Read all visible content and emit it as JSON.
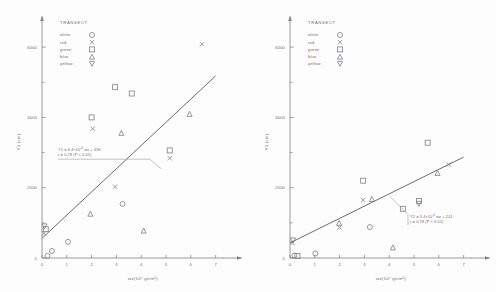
{
  "figure": {
    "background": "#fdfdfd",
    "ink": "#6e6e76",
    "marker_stroke": "#77777f"
  },
  "legend": {
    "title": "TRANSECT",
    "entries": [
      {
        "label": "white",
        "symbol": "circle",
        "icon": "circle-marker-icon"
      },
      {
        "label": "red",
        "symbol": "cross",
        "icon": "x-marker-icon"
      },
      {
        "label": "green",
        "symbol": "square",
        "icon": "square-marker-icon"
      },
      {
        "label": "blue",
        "symbol": "triangle-up",
        "icon": "triangle-up-marker-icon"
      },
      {
        "label": "yellow",
        "symbol": "triangle-down",
        "icon": "triangle-down-marker-icon"
      }
    ]
  },
  "chart_data": [
    {
      "id": "panel-left",
      "type": "scatter",
      "title": "",
      "xlabel": "wz(10⁴ g/cm³)",
      "ylabel": "Y1 (cm)",
      "xlim": [
        0,
        7.5
      ],
      "ylim": [
        0,
        6600
      ],
      "xticks": [
        0,
        1,
        2,
        3,
        4,
        5,
        6,
        7
      ],
      "xtick_labels": [
        "0",
        "1",
        "2",
        "3",
        "4",
        "5",
        "6",
        "7"
      ],
      "yticks": [
        0,
        2000,
        4000,
        6000
      ],
      "ytick_labels": [
        "0",
        "2000",
        "4000",
        "6000"
      ],
      "grid": false,
      "legend_position": "top-left",
      "annotation": {
        "line1_pre": "Y1 = 6.4×10",
        "line1_exp": "-4",
        "line1_post": " wz + 494",
        "line2": "r = 0.78 (P < 0.01)"
      },
      "regression": {
        "x0": 0.0,
        "y0": 560,
        "x1": 7.0,
        "y1": 5180
      },
      "series": [
        {
          "name": "white",
          "symbol": "circle",
          "points": [
            {
              "x": 0.22,
              "y": 60
            },
            {
              "x": 0.4,
              "y": 200
            },
            {
              "x": 1.05,
              "y": 460
            },
            {
              "x": 3.25,
              "y": 1540
            }
          ]
        },
        {
          "name": "red",
          "symbol": "cross",
          "points": [
            {
              "x": 0.08,
              "y": 700
            },
            {
              "x": 2.05,
              "y": 3680
            },
            {
              "x": 2.95,
              "y": 2030
            },
            {
              "x": 5.15,
              "y": 2840
            },
            {
              "x": 6.45,
              "y": 6080
            }
          ]
        },
        {
          "name": "green",
          "symbol": "square",
          "points": [
            {
              "x": 0.15,
              "y": 820
            },
            {
              "x": 2.0,
              "y": 4000
            },
            {
              "x": 2.95,
              "y": 4860
            },
            {
              "x": 3.62,
              "y": 4680
            },
            {
              "x": 5.15,
              "y": 3060
            }
          ]
        },
        {
          "name": "blue",
          "symbol": "triangle-up",
          "points": [
            {
              "x": 1.95,
              "y": 1260
            },
            {
              "x": 3.2,
              "y": 3560
            },
            {
              "x": 4.1,
              "y": 780
            },
            {
              "x": 5.95,
              "y": 4100
            }
          ]
        },
        {
          "name": "yellow",
          "symbol": "triangle-down",
          "points": [
            {
              "x": 0.1,
              "y": 900
            }
          ]
        }
      ]
    },
    {
      "id": "panel-right",
      "type": "scatter",
      "title": "",
      "xlabel": "wz(10⁴ g/cm³)",
      "ylabel": "Y2 (cm)",
      "xlim": [
        0,
        7.5
      ],
      "ylim": [
        0,
        6600
      ],
      "xticks": [
        0,
        1,
        2,
        3,
        4,
        5,
        6,
        7
      ],
      "xtick_labels": [
        "0",
        "1",
        "2",
        "3",
        "4",
        "5",
        "6",
        "7"
      ],
      "yticks": [
        0,
        2000,
        4000,
        6000
      ],
      "ytick_labels": [
        "0",
        "2000",
        "4000",
        "6000"
      ],
      "grid": false,
      "legend_position": "top-left",
      "annotation": {
        "line1_pre": "Y2 = 5.4×10",
        "line1_exp": "-4",
        "line1_post": " wz + 241",
        "line2": "r = 0.78 (P < 0.01)"
      },
      "regression": {
        "x0": 0.0,
        "y0": 430,
        "x1": 7.0,
        "y1": 2870
      },
      "series": [
        {
          "name": "white",
          "symbol": "circle",
          "points": [
            {
              "x": 0.18,
              "y": 70
            },
            {
              "x": 1.02,
              "y": 130
            },
            {
              "x": 3.22,
              "y": 880
            }
          ]
        },
        {
          "name": "red",
          "symbol": "cross",
          "points": [
            {
              "x": 0.1,
              "y": 430
            },
            {
              "x": 2.0,
              "y": 870
            },
            {
              "x": 2.95,
              "y": 1650
            },
            {
              "x": 6.4,
              "y": 2660
            }
          ]
        },
        {
          "name": "green",
          "symbol": "square",
          "points": [
            {
              "x": 0.3,
              "y": 60
            },
            {
              "x": 2.95,
              "y": 2200
            },
            {
              "x": 4.55,
              "y": 1400
            },
            {
              "x": 5.2,
              "y": 1620
            },
            {
              "x": 5.55,
              "y": 3280
            }
          ]
        },
        {
          "name": "blue",
          "symbol": "triangle-up",
          "points": [
            {
              "x": 1.98,
              "y": 1000
            },
            {
              "x": 3.3,
              "y": 1680
            },
            {
              "x": 4.15,
              "y": 300
            },
            {
              "x": 5.95,
              "y": 2420
            }
          ]
        },
        {
          "name": "yellow",
          "symbol": "triangle-down",
          "points": [
            {
              "x": 0.12,
              "y": 500
            },
            {
              "x": 5.2,
              "y": 1540
            }
          ]
        }
      ]
    }
  ]
}
